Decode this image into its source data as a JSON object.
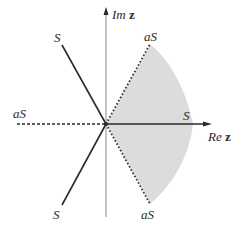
{
  "diagram": {
    "type": "complex-plane-sector",
    "axes": {
      "imaginary": {
        "label_prefix": "Im",
        "label_var": "z"
      },
      "real": {
        "label_prefix": "Re",
        "label_var": "z"
      }
    },
    "rays": [
      {
        "id": "upper-left",
        "label": "S",
        "style": "solid"
      },
      {
        "id": "lower-left",
        "label": "S",
        "style": "solid"
      },
      {
        "id": "positive-real",
        "label": "S",
        "style": "solid"
      },
      {
        "id": "negative-real",
        "label": "aS",
        "style": "dashed"
      },
      {
        "id": "upper-right",
        "label": "aS",
        "style": "dotted"
      },
      {
        "id": "lower-right",
        "label": "aS",
        "style": "dotted"
      }
    ],
    "shaded_region": {
      "description": "sector between aS rays on right half-plane",
      "color": "#dcdcdc"
    },
    "colors": {
      "line": "#2a2a2a",
      "axis": "#888888",
      "shade": "#dcdcdc"
    }
  }
}
